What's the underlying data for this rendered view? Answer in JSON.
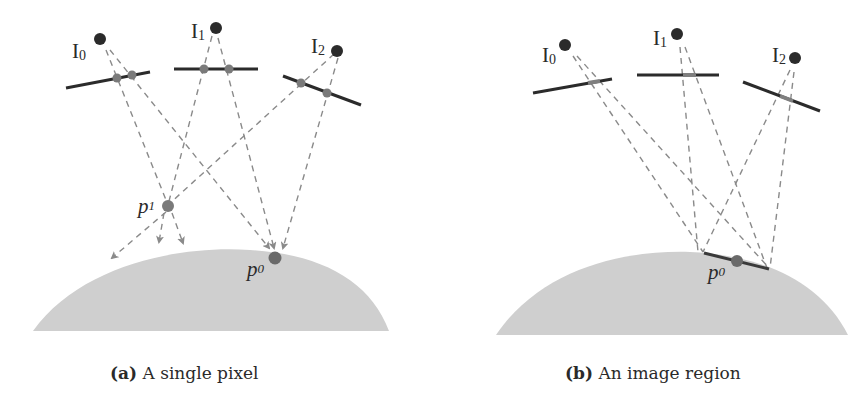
{
  "figure": {
    "panels": [
      {
        "id": "a",
        "caption": {
          "tag": "(a)",
          "text": "A single pixel"
        },
        "cameras": [
          {
            "label": "I",
            "sub": "0"
          },
          {
            "label": "I",
            "sub": "1"
          },
          {
            "label": "I",
            "sub": "2"
          }
        ],
        "points": [
          {
            "label": "p",
            "sub": "1"
          },
          {
            "label": "p",
            "sub": "0"
          }
        ]
      },
      {
        "id": "b",
        "caption": {
          "tag": "(b)",
          "text": "An image region"
        },
        "cameras": [
          {
            "label": "I",
            "sub": "0"
          },
          {
            "label": "I",
            "sub": "1"
          },
          {
            "label": "I",
            "sub": "2"
          }
        ],
        "points": [
          {
            "label": "p",
            "sub": "0"
          }
        ]
      }
    ],
    "colors": {
      "surface": "#cfcfcf",
      "camera_dot": "#2b2b2b",
      "image_plane": "#2b2b2b",
      "ray": "#8a8a8a",
      "pixel": "#7a7a7a",
      "point": "#6a6a6a"
    }
  }
}
